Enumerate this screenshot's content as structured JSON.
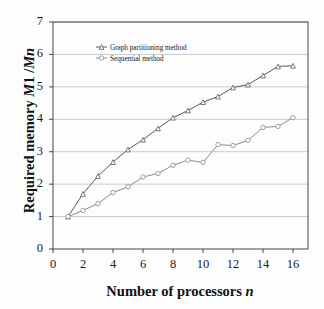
{
  "chart_data": {
    "type": "line",
    "title": "",
    "xlabel": "Number of processors n",
    "ylabel": "Required memory M1 /Mn",
    "xlim": [
      0,
      17
    ],
    "ylim": [
      0,
      7
    ],
    "xticks": [
      "0",
      "2",
      "4",
      "6",
      "8",
      "10",
      "12",
      "14",
      "16"
    ],
    "yticks": [
      "0",
      "1",
      "2",
      "3",
      "4",
      "5",
      "6",
      "7"
    ],
    "grid": "horizontal",
    "legend_position": "upper-left-inside",
    "x": [
      1,
      2,
      3,
      4,
      5,
      6,
      7,
      8,
      9,
      10,
      11,
      12,
      13,
      14,
      15,
      16
    ],
    "series": [
      {
        "name": "Graph partitioning method",
        "color": "#5a5a5a",
        "marker": "triangle",
        "values": [
          1.0,
          1.7,
          2.25,
          2.68,
          3.07,
          3.37,
          3.72,
          4.05,
          4.27,
          4.53,
          4.7,
          4.98,
          5.07,
          5.35,
          5.63,
          5.65
        ]
      },
      {
        "name": "Sequential method",
        "color": "#8c8c8c",
        "marker": "circle",
        "values": [
          1.0,
          1.19,
          1.4,
          1.74,
          1.92,
          2.22,
          2.33,
          2.58,
          2.74,
          2.67,
          3.22,
          3.19,
          3.35,
          3.75,
          3.78,
          4.05
        ]
      }
    ]
  },
  "axes": {
    "y_title_plain_1": "Required memory ",
    "y_title_italic": "M",
    "y_title_plain_2": "1 /",
    "y_title_italic_2": "Mn",
    "x_title_plain": "Number of processors ",
    "x_title_italic": "n"
  },
  "colors": {
    "background": "#ffffff",
    "grid": "#b4b4b4",
    "axis": "#333333",
    "series_1": "#5a5a5a",
    "series_2": "#8c8c8c"
  }
}
